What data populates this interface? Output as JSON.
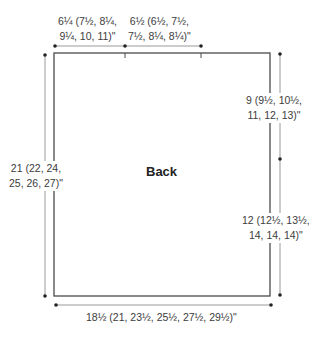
{
  "diagram": {
    "type": "knitting-schematic",
    "piece_title": "Back",
    "measurements": {
      "top_left_width": {
        "line1": "6¼ (7½, 8¼,",
        "line2": "9¼, 10, 11)\""
      },
      "top_right_width": {
        "line1": "6½ (6½, 7½,",
        "line2": "7½, 8¼, 8¼)\""
      },
      "upper_right_length": {
        "line1": "9 (9½, 10½,",
        "line2": "11, 12, 13)\""
      },
      "lower_right_length": {
        "line1": "12 (12½, 13½,",
        "line2": "14, 14, 14)\""
      },
      "left_total_length": {
        "line1": "21 (22, 24,",
        "line2": "25, 26, 27)\""
      },
      "bottom_width": {
        "line1": "18½ (21, 23½, 25½, 27½, 29½)\""
      }
    },
    "colors": {
      "outline": "#4a4a4a",
      "dimension_line": "#9a9a9a",
      "dot": "#222222",
      "text": "#3c3c3c"
    }
  }
}
